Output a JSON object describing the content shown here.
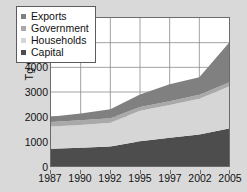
{
  "chart_data": {
    "type": "area",
    "stacked": true,
    "title": "",
    "xlabel": "",
    "ylabel": "Tg CO2",
    "ylabel_display": "Tg CO",
    "ylabel_sub": "2",
    "categories": [
      "1987",
      "1990",
      "1992",
      "1995",
      "1997",
      "2002",
      "2005"
    ],
    "ylim": [
      0,
      6000
    ],
    "ytick_values": [
      6000,
      5000,
      4000,
      3000,
      2000,
      1000,
      0
    ],
    "ytick_labels": [
      "6000",
      "5000",
      "4000",
      "3000",
      "2000",
      "1000",
      "0"
    ],
    "grid": true,
    "legend_position": "upper-left-inside",
    "series": [
      {
        "name": "Capital",
        "color": "#4d4d4d",
        "stack_order": 1,
        "values": [
          700,
          740,
          790,
          1000,
          1150,
          1280,
          1520
        ]
      },
      {
        "name": "Households",
        "color": "#d6d6d6",
        "stack_order": 2,
        "values": [
          900,
          920,
          960,
          1240,
          1320,
          1450,
          1700
        ]
      },
      {
        "name": "Government",
        "color": "#a9a9a9",
        "stack_order": 3,
        "values": [
          180,
          190,
          190,
          150,
          150,
          160,
          170
        ]
      },
      {
        "name": "Exports",
        "color": "#808080",
        "stack_order": 4,
        "values": [
          220,
          280,
          360,
          510,
          690,
          710,
          1610
        ]
      }
    ],
    "cumulative_tops": {
      "capital": [
        700,
        740,
        790,
        1000,
        1150,
        1280,
        1520
      ],
      "households": [
        1600,
        1660,
        1750,
        2240,
        2470,
        2730,
        3220
      ],
      "government": [
        1780,
        1850,
        1940,
        2390,
        2620,
        2890,
        3390
      ],
      "exports": [
        2000,
        2130,
        2300,
        2900,
        3310,
        3600,
        5000
      ]
    }
  },
  "legend": {
    "items": [
      {
        "label": "Exports",
        "color": "#808080"
      },
      {
        "label": "Government",
        "color": "#a9a9a9"
      },
      {
        "label": "Households",
        "color": "#d6d6d6"
      },
      {
        "label": "Capital",
        "color": "#4d4d4d"
      }
    ]
  },
  "colors": {
    "page_background": "#d9d9d9",
    "plot_background": "#ffffff",
    "axis": "#6b6b6b",
    "gridline": "#8a8a8a",
    "text": "#111111"
  }
}
